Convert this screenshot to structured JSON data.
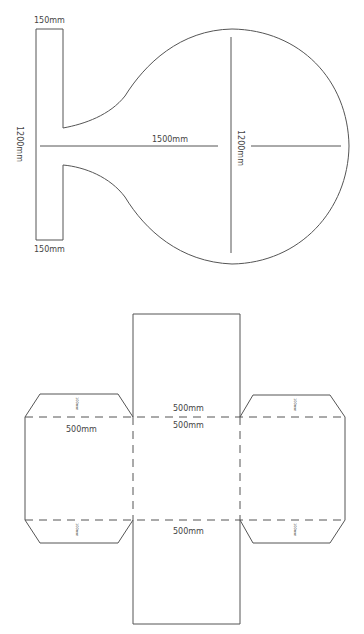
{
  "diagram_top": {
    "title": "Mirror stand template",
    "labels": {
      "stem_top_width": "150mm",
      "stem_bottom_width": "150mm",
      "stem_height": "1200mm",
      "total_length": "1500mm",
      "circle_diameter": "1200mm"
    }
  },
  "diagram_bottom": {
    "title": "Box net",
    "labels": {
      "top_panel": "500mm",
      "center_panel": "500mm",
      "left_panel": "500mm",
      "bottom_panel": "500mm",
      "flap_top_left": "100mm",
      "flap_top_right": "100mm",
      "flap_bottom_left": "100mm",
      "flap_bottom_right": "100mm"
    }
  },
  "colors": {
    "stroke": "#555555",
    "text": "#444444",
    "background": "#ffffff"
  }
}
